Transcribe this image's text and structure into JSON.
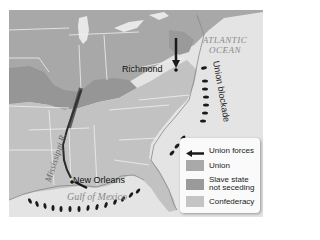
{
  "map": {
    "subject": "Union strategy map: Mississippi River advance and coastal blockade",
    "labels": {
      "richmond": "Richmond",
      "new_orleans": "New Orleans",
      "atlantic_line1": "ATLANTIC",
      "atlantic_line2": "OCEAN",
      "mississippi": "Mississippi R.",
      "union_blockade": "Union blockade",
      "gulf": "Gulf of Mexico"
    },
    "colors": {
      "union": "#a9a9a9",
      "slave_state_not_seceding": "#9a9a9a",
      "confederacy": "#c4c4c4",
      "water": "#e6e6e6",
      "borders": "#f2f2f2",
      "forces": "#1a1a1a"
    }
  },
  "legend": {
    "items": [
      {
        "icon": "arrow-left-icon",
        "label": "Union forces"
      },
      {
        "icon": "swatch",
        "label": "Union",
        "color": "#a9a9a9"
      },
      {
        "icon": "swatch",
        "label_line1": "Slave state",
        "label_line2": "not seceding",
        "color": "#9a9a9a"
      },
      {
        "icon": "swatch",
        "label": "Confederacy",
        "color": "#c4c4c4"
      }
    ]
  }
}
